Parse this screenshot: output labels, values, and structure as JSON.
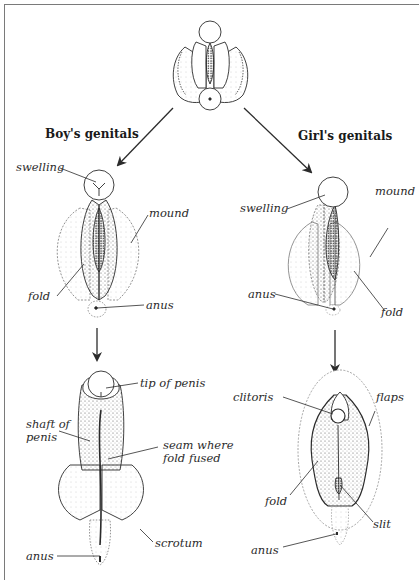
{
  "diagram": {
    "start_node": {
      "label": "",
      "description": "undifferentiated embryonic genitals"
    },
    "branches": {
      "boy": {
        "heading": "Boy's genitals",
        "stage1": {
          "labels": {
            "swelling": "swelling",
            "mound": "mound",
            "fold": "fold",
            "anus": "anus"
          }
        },
        "stage2": {
          "labels": {
            "tip_of_penis": "tip of penis",
            "shaft_line1": "shaft of",
            "shaft_line2": "penis",
            "seam_line1": "seam where",
            "seam_line2": "fold fused",
            "scrotum": "scrotum",
            "anus": "anus"
          }
        }
      },
      "girl": {
        "heading": "Girl's genitals",
        "stage1": {
          "labels": {
            "swelling": "swelling",
            "mound": "mound",
            "anus": "anus",
            "fold": "fold"
          }
        },
        "stage2": {
          "labels": {
            "clitoris": "clitoris",
            "flaps": "flaps",
            "fold": "fold",
            "slit": "slit",
            "anus": "anus"
          }
        }
      }
    },
    "colors": {
      "line": "#2b2b2b",
      "stipple": "#6e6e6e",
      "frame": "#7a7a7a",
      "background": "#ffffff"
    }
  }
}
